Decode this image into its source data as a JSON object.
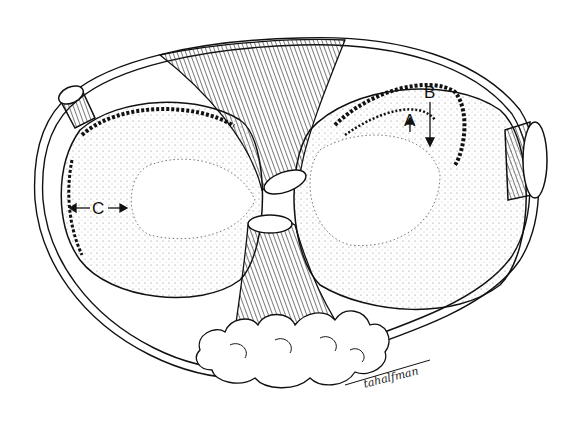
{
  "figure": {
    "type": "anatomical line illustration",
    "labels": [
      {
        "id": "A",
        "text": "A",
        "pointer": "short arrow pointing down to inner dotted boundary"
      },
      {
        "id": "B",
        "text": "B",
        "pointer": "long arrow pointing down past scalloped edge"
      },
      {
        "id": "C",
        "text": "C",
        "pointer": "double arrow between outer scalloped edge and inner dotted boundary"
      }
    ],
    "signature": "tahalfman",
    "colors": {
      "ink": "#111111",
      "background": "#ffffff",
      "stipple": "#555555"
    }
  }
}
